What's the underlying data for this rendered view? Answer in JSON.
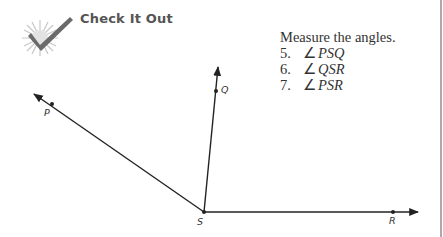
{
  "header": {
    "icon": "checkmark-burst-icon",
    "title": "Check It Out"
  },
  "instructions": "Measure the angles.",
  "questions": [
    {
      "number": "5.",
      "symbol": "∠",
      "angle": "PSQ"
    },
    {
      "number": "6.",
      "symbol": "∠",
      "angle": "QSR"
    },
    {
      "number": "7.",
      "symbol": "∠",
      "angle": "PSR"
    }
  ],
  "diagram": {
    "vertex": {
      "label": "S",
      "x": 204,
      "y": 212
    },
    "rays": [
      {
        "name": "SP",
        "point_label": "P",
        "point": [
          52,
          104
        ],
        "tip": [
          34,
          94
        ]
      },
      {
        "name": "SQ",
        "point_label": "Q",
        "point": [
          216,
          91
        ],
        "tip": [
          218,
          67
        ]
      },
      {
        "name": "SR",
        "point_label": "R",
        "point": [
          393,
          212
        ],
        "tip": [
          418,
          212
        ]
      }
    ],
    "colors": {
      "line": "#222222"
    }
  }
}
